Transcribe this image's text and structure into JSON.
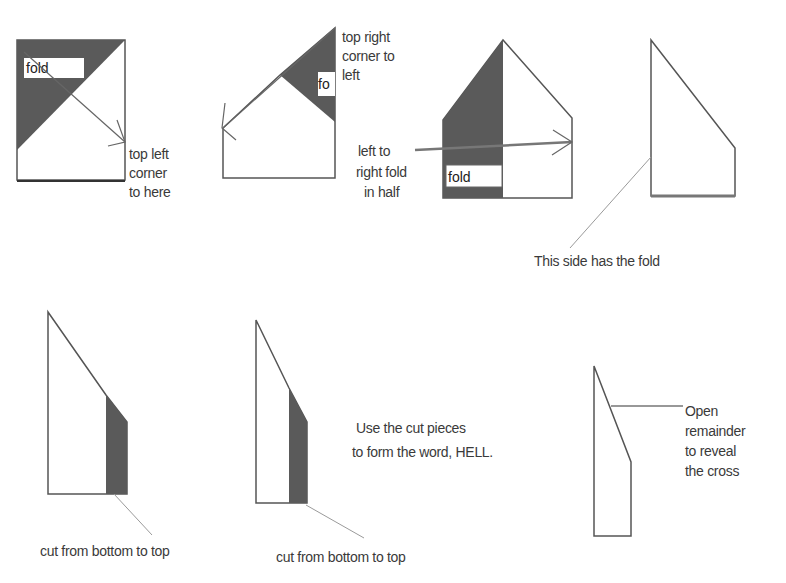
{
  "diagram": {
    "steps": [
      {
        "id": 1,
        "box_label": "fold",
        "caption": [
          "top left",
          "corner",
          "to here"
        ]
      },
      {
        "id": 2,
        "box_label": "fo",
        "caption": [
          "top right",
          "corner to",
          "left"
        ]
      },
      {
        "id": 3,
        "box_label": "fold",
        "caption": [
          "left to",
          "right fold",
          "in half"
        ]
      },
      {
        "id": 4,
        "caption": [
          "This side has the fold"
        ]
      },
      {
        "id": 5,
        "caption": [
          "cut from bottom to top"
        ]
      },
      {
        "id": 6,
        "caption": [
          "cut from bottom to top"
        ],
        "note": [
          "Use the cut pieces",
          "to form the word, HELL."
        ]
      },
      {
        "id": 7,
        "caption": [
          "Open",
          "remainder",
          "to reveal",
          "the cross"
        ]
      }
    ],
    "colors": {
      "shade": "#5a5a5a",
      "line": "#555555",
      "text": "#3a3a3a"
    }
  }
}
